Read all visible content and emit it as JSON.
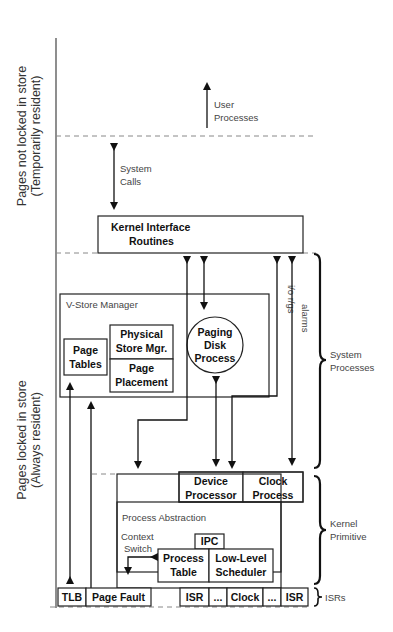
{
  "diagram": {
    "side_labels": {
      "top": {
        "line1": "Pages not locked in store",
        "line2": "(Temporarily resident)"
      },
      "bottom": {
        "line1": "Pages locked in store",
        "line2": "(Always resident)"
      }
    },
    "annotations": {
      "user_processes": {
        "line1": "User",
        "line2": "Processes"
      },
      "system_calls": {
        "line1": "System",
        "line2": "Calls"
      },
      "io_rqs": "i/o r/gs",
      "alarms": "alarms",
      "context_switch": {
        "line1": "Context",
        "line2": "Switch"
      }
    },
    "boxes": {
      "kernel_interface": {
        "line1": "Kernel Interface",
        "line2": "Routines"
      },
      "vstore_manager": "V-Store Manager",
      "page_tables": {
        "line1": "Page",
        "line2": "Tables"
      },
      "physical_store_mgr": {
        "line1": "Physical",
        "line2": "Store Mgr."
      },
      "page_placement": {
        "line1": "Page",
        "line2": "Placement"
      },
      "paging_disk_process": {
        "line1": "Paging",
        "line2": "Disk",
        "line3": "Process"
      },
      "device_processor": {
        "line1": "Device",
        "line2": "Processor"
      },
      "clock_process": {
        "line1": "Clock",
        "line2": "Process"
      },
      "process_abstraction": "Process Abstraction",
      "ipc": "IPC",
      "process_table": {
        "line1": "Process",
        "line2": "Table"
      },
      "low_level_scheduler": {
        "line1": "Low-Level",
        "line2": "Scheduler"
      },
      "tlb": "TLB",
      "page_fault": "Page Fault",
      "isr_row": [
        "ISR",
        "...",
        "Clock",
        "...",
        "ISR"
      ]
    },
    "brace_labels": {
      "system_processes": {
        "line1": "System",
        "line2": "Processes"
      },
      "kernel_primitive": {
        "line1": "Kernel",
        "line2": "Primitive"
      },
      "isrs": "ISRs"
    }
  }
}
